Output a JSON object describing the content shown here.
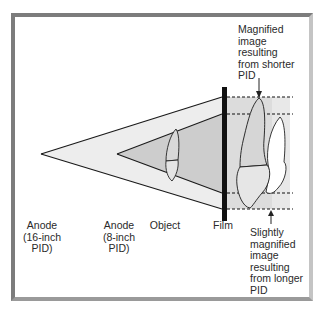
{
  "diagram": {
    "type": "radiographic-projection-geometry",
    "labels": {
      "anode_16": "Anode\n(16-inch\nPID)",
      "anode_8": "Anode\n(8-inch\nPID)",
      "object": "Object",
      "film": "Film",
      "magnified_shorter": "Magnified\nimage\nresulting\nfrom shorter\nPID",
      "magnified_longer": "Slightly\nmagnified\nimage\nresulting\nfrom longer\nPID"
    },
    "colors": {
      "frame_border": "#7c7c7c",
      "outer_beam_fill": "#ececec",
      "inner_beam_fill": "#cfcfcf",
      "film_region_fill": "#d6d6d6",
      "film_region_light": "#e6e6e6",
      "film_bar": "#111111",
      "outline": "#1a1a1a",
      "tooth_fill": "#e8e8e8",
      "tooth_light": "#ffffff"
    },
    "geometry": {
      "anode_16": {
        "x": 41,
        "y": 154
      },
      "anode_8": {
        "x": 117,
        "y": 154
      },
      "film_x": 222,
      "dashed_lines_y": [
        97,
        114,
        193,
        209
      ]
    }
  }
}
